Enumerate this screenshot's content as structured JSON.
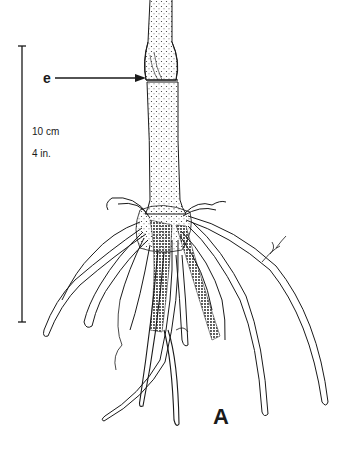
{
  "figure": {
    "panel_label": "A",
    "annotation_label": "e",
    "scale_bar": {
      "metric_label": "10 cm",
      "imperial_label": "4 in."
    },
    "colors": {
      "ink": "#1a1a1a",
      "background": "#ffffff"
    }
  }
}
